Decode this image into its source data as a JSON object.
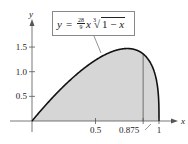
{
  "chart_data": {
    "type": "area",
    "title": "",
    "formula": {
      "lhs": "y",
      "eq": "=",
      "coef_num": "28",
      "coef_den": "9",
      "var": "x",
      "root_index": "3",
      "radicand_a": "1 − ",
      "radicand_b": "x"
    },
    "xlabel": "x",
    "ylabel": "y",
    "xlim": [
      0,
      1.05
    ],
    "ylim": [
      0,
      1.75
    ],
    "x_ticks": [
      0.5,
      0.875,
      1
    ],
    "x_tick_labels": [
      "0.5",
      "0.875",
      "1"
    ],
    "y_ticks": [
      0.5,
      1.0,
      1.5
    ],
    "y_tick_labels": [
      "0.5",
      "1.0",
      "1.5"
    ],
    "shaded_region": {
      "from": 0,
      "to": 1,
      "color": "#d6d6d6"
    },
    "vertical_line_at": 0.875,
    "grid": false,
    "series": [
      {
        "name": "y = 28/9 x (1-x)^(1/3)",
        "x": [
          0,
          0.1,
          0.2,
          0.3,
          0.4,
          0.5,
          0.6,
          0.7,
          0.75,
          0.8,
          0.85,
          0.875,
          0.9,
          0.95,
          0.98,
          0.99,
          0.995,
          0.999,
          1
        ],
        "y": [
          0,
          0.3,
          0.578,
          0.829,
          1.05,
          1.235,
          1.375,
          1.458,
          1.47,
          1.455,
          1.405,
          1.361,
          1.3,
          1.089,
          0.827,
          0.663,
          0.529,
          0.311,
          0
        ]
      }
    ],
    "colors": {
      "curve": "#111111",
      "fill": "#d6d6d6",
      "axes": "#555555"
    }
  }
}
